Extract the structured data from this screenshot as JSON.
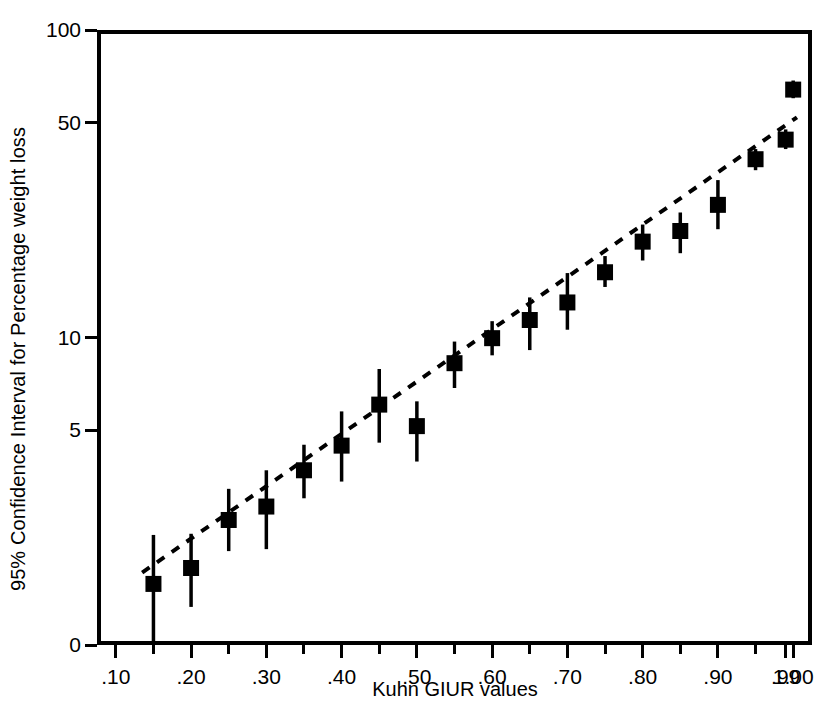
{
  "chart_data": {
    "type": "scatter",
    "title": "",
    "xlabel": "Kuhn GIUR values",
    "ylabel": "95% Confidence Interval for Percentage weight loss",
    "y_scale": "log",
    "ylim": [
      1.0,
      100
    ],
    "y_ticks": [
      0,
      5,
      10,
      50,
      100
    ],
    "y_tick_labels": [
      "0",
      "5",
      "10",
      "50",
      "100"
    ],
    "xlim": [
      0.075,
      1.025
    ],
    "x_ticks": [
      0.1,
      0.2,
      0.3,
      0.4,
      0.5,
      0.6,
      0.7,
      0.8,
      0.9,
      0.99,
      1.0
    ],
    "x_tick_labels": [
      ".10",
      ".20",
      ".30",
      ".40",
      ".50",
      ".60",
      ".70",
      ".80",
      ".90",
      ".99",
      "1.00"
    ],
    "x_minor_ticks": [
      0.15,
      0.25,
      0.35,
      0.45,
      0.55,
      0.65,
      0.75,
      0.85,
      0.95
    ],
    "grid": false,
    "legend": false,
    "marker": "square",
    "marker_color": "#000000",
    "errorbar_color": "#000000",
    "trendline": {
      "style": "dashed",
      "color": "#000000",
      "x_start": 0.135,
      "y_start": 1.72,
      "x_end": 1.005,
      "y_end": 52.0
    },
    "points": [
      {
        "x": 0.15,
        "y": 1.58,
        "lo": 1.0,
        "hi": 2.28
      },
      {
        "x": 0.2,
        "y": 1.78,
        "lo": 1.33,
        "hi": 2.3
      },
      {
        "x": 0.25,
        "y": 2.55,
        "lo": 2.02,
        "hi": 3.22
      },
      {
        "x": 0.3,
        "y": 2.82,
        "lo": 2.05,
        "hi": 3.7
      },
      {
        "x": 0.35,
        "y": 3.7,
        "lo": 3.0,
        "hi": 4.48
      },
      {
        "x": 0.4,
        "y": 4.45,
        "lo": 3.4,
        "hi": 5.75
      },
      {
        "x": 0.45,
        "y": 6.05,
        "lo": 4.55,
        "hi": 7.9
      },
      {
        "x": 0.5,
        "y": 5.15,
        "lo": 3.95,
        "hi": 6.2
      },
      {
        "x": 0.55,
        "y": 8.25,
        "lo": 6.85,
        "hi": 9.7
      },
      {
        "x": 0.6,
        "y": 9.95,
        "lo": 8.75,
        "hi": 11.3
      },
      {
        "x": 0.65,
        "y": 11.4,
        "lo": 9.1,
        "hi": 13.5
      },
      {
        "x": 0.7,
        "y": 13.0,
        "lo": 10.6,
        "hi": 16.2
      },
      {
        "x": 0.75,
        "y": 16.3,
        "lo": 14.6,
        "hi": 18.4
      },
      {
        "x": 0.8,
        "y": 20.5,
        "lo": 17.8,
        "hi": 23.3
      },
      {
        "x": 0.85,
        "y": 22.2,
        "lo": 18.8,
        "hi": 25.5
      },
      {
        "x": 0.9,
        "y": 27.0,
        "lo": 22.5,
        "hi": 32.5
      },
      {
        "x": 0.95,
        "y": 38.0,
        "lo": 35.0,
        "hi": 41.0
      },
      {
        "x": 0.99,
        "y": 44.0,
        "lo": 41.0,
        "hi": 47.5
      },
      {
        "x": 1.0,
        "y": 64.0,
        "lo": 60.0,
        "hi": 68.5
      }
    ]
  }
}
